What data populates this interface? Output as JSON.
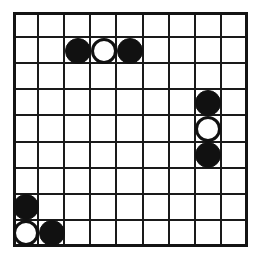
{
  "board": {
    "name": "reversi-board",
    "rows": 9,
    "columns": 9,
    "cell_size_px": 26,
    "grid_line_color": "#1a1a1a",
    "frame_color": "#141414",
    "background_color": "#ffffff",
    "black_stone_color": "#111111",
    "white_stone_color": "#ffffff",
    "white_stone_outline_color": "#111111",
    "stone_counts": {
      "black": 6,
      "white": 3,
      "total": 9,
      "empty_cells": 72
    },
    "stones": [
      {
        "row": 2,
        "col": 3,
        "color": "black"
      },
      {
        "row": 2,
        "col": 4,
        "color": "white"
      },
      {
        "row": 2,
        "col": 5,
        "color": "black"
      },
      {
        "row": 4,
        "col": 8,
        "color": "black"
      },
      {
        "row": 5,
        "col": 8,
        "color": "white"
      },
      {
        "row": 6,
        "col": 8,
        "color": "black"
      },
      {
        "row": 8,
        "col": 1,
        "color": "black"
      },
      {
        "row": 9,
        "col": 1,
        "color": "white"
      },
      {
        "row": 9,
        "col": 2,
        "color": "black"
      }
    ]
  }
}
